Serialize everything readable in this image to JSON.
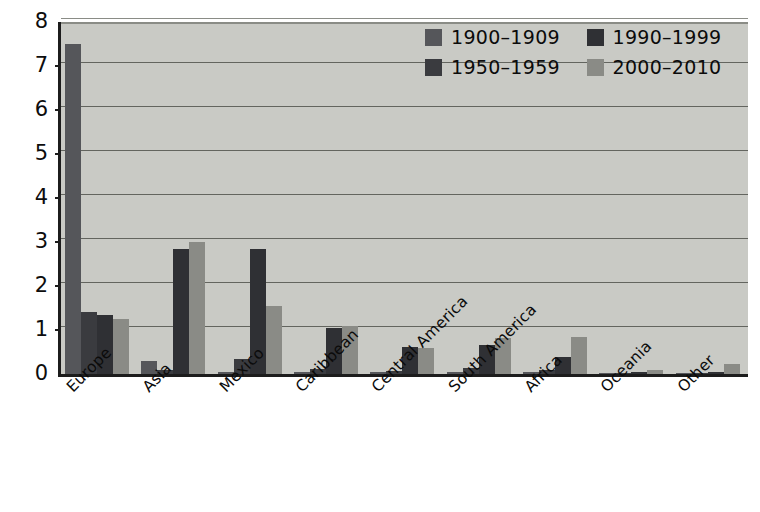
{
  "chart_data": {
    "type": "bar",
    "title": "",
    "subtitle": "",
    "xlabel": "",
    "ylabel": "",
    "ylim": [
      0,
      8
    ],
    "yticks": [
      "0",
      "1",
      "2",
      "3",
      "4",
      "5",
      "6",
      "7",
      "8"
    ],
    "grid": true,
    "grid_orientation": "horizontal",
    "legend_position": "top-right",
    "legend_columns": 2,
    "categories": [
      "Europe",
      "Asia",
      "Mexico",
      "Caribbean",
      "Central America",
      "South America",
      "Africa",
      "Oceania",
      "Other"
    ],
    "series": [
      {
        "name": "1900–1909",
        "color": "#55565a",
        "values": [
          7.5,
          0.3,
          0.03,
          0.02,
          0.02,
          0.02,
          0.02,
          0.0,
          0.0
        ]
      },
      {
        "name": "1950–1959",
        "color": "#3a3b3f",
        "values": [
          1.4,
          0.1,
          0.35,
          0.12,
          0.07,
          0.13,
          0.1,
          0.0,
          0.0
        ]
      },
      {
        "name": "1990–1999",
        "color": "#2f3034",
        "values": [
          1.35,
          2.85,
          2.85,
          1.05,
          0.62,
          0.65,
          0.38,
          0.02,
          0.03
        ]
      },
      {
        "name": "2000–2010",
        "color": "#8a8b86",
        "values": [
          1.25,
          3.0,
          1.55,
          1.08,
          0.58,
          0.82,
          0.85,
          0.1,
          0.22
        ]
      }
    ]
  },
  "colors": {
    "plot_background": "#c9cac5",
    "page_background": "#ffffff",
    "axis": "#1c1c1c",
    "gridline": "#63655f",
    "text": "#0b0b0b"
  }
}
